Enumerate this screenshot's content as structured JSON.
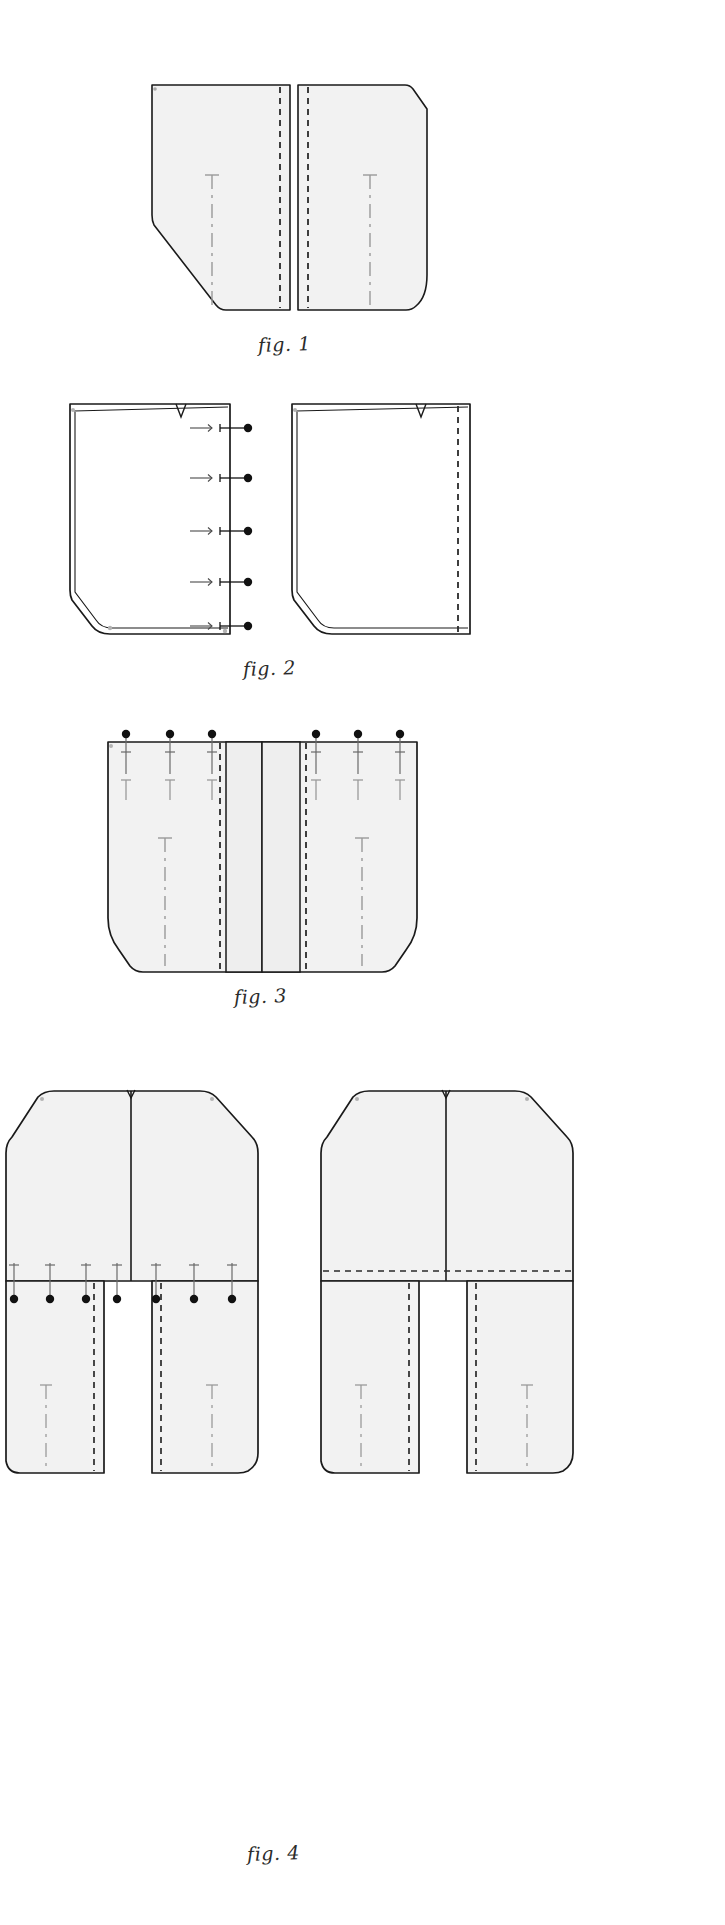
{
  "document": {
    "kind": "sewing-pattern-instruction-sheet",
    "title": "Sewing pattern construction steps",
    "background_color": "#ffffff",
    "width": 725,
    "height": 1925
  },
  "style": {
    "fabric_fill": "#f2f2f2",
    "fabric_fill_alt": "#efefef",
    "outline_color": "#1a1a1a",
    "stitch_color": "#2a2a2a",
    "grain_color": "#8c8c8c",
    "pin_color": "#111111",
    "caption_color": "#2b2b2b"
  },
  "legend": {
    "solid_line": "cut edge / fabric outline",
    "dashed_line": "stitch line",
    "dash_dot_line": "grain line / fold line",
    "pin_symbol": "pin",
    "notch_symbol": "notch",
    "arrow_symbol": "seam allowance direction"
  },
  "figures": [
    {
      "id": "fig-1",
      "caption": "fig. 1",
      "caption_x": 258,
      "caption_y": 333,
      "description": "Two cut pattern pieces laid flat, right sides up, showing stitch lines along the centre-back edges and grain markings.",
      "pieces": [
        {
          "name": "left-panel",
          "stitch_lines": 1,
          "grain_lines": 1,
          "notches": 0,
          "pins": 0
        },
        {
          "name": "right-panel",
          "stitch_lines": 1,
          "grain_lines": 1,
          "notches": 0,
          "pins": 0
        }
      ]
    },
    {
      "id": "fig-2",
      "caption": "fig. 2",
      "caption_x": 243,
      "caption_y": 657,
      "description": "Pieces folded with seam allowance turned; pins inserted along the open centre edge of the left piece and a notch marked on the upper edge.",
      "pieces": [
        {
          "name": "left-panel-folded",
          "stitch_lines": 0,
          "grain_lines": 0,
          "notches": 1,
          "pins": 5,
          "arrows": 5
        },
        {
          "name": "right-panel-folded",
          "stitch_lines": 1,
          "grain_lines": 0,
          "notches": 1,
          "pins": 0
        }
      ]
    },
    {
      "id": "fig-3",
      "caption": "fig. 3",
      "caption_x": 234,
      "caption_y": 985,
      "description": "Both panels joined at the centre with an inserted placket band; pins placed across the top edge and stitch lines either side of the band.",
      "pieces": [
        {
          "name": "joined-body",
          "stitch_lines": 2,
          "grain_lines": 2,
          "notches": 0,
          "pins": 6,
          "band_panels": 2
        }
      ]
    },
    {
      "id": "fig-4",
      "caption": "fig. 4",
      "caption_x": 247,
      "caption_y": 1842,
      "description": "Left: bodice pinned to the leg sections along the waist seam with pins and grain markings. Right: the same assembly with the waist seam stitched, shown as a dashed stitch line.",
      "pieces": [
        {
          "name": "pinned-assembly-left",
          "stitch_lines": 2,
          "grain_lines": 2,
          "notches": 1,
          "pins": 7
        },
        {
          "name": "stitched-assembly-right",
          "stitch_lines": 3,
          "grain_lines": 2,
          "notches": 1,
          "pins": 0
        }
      ]
    }
  ]
}
